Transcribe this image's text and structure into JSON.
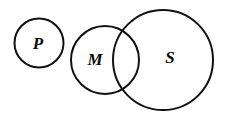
{
  "figure": {
    "type": "euler-diagram",
    "background_color": "#ffffff",
    "stroke_color": "#111111",
    "label_color": "#0a0a0a",
    "width": 228,
    "height": 120
  },
  "sets": [
    {
      "id": "P",
      "label": "P",
      "name": "circle-p",
      "cx": 39,
      "cy": 43,
      "r": 24.5,
      "label_x": 38,
      "label_y": 45,
      "label_size": 17,
      "overlaps": []
    },
    {
      "id": "M",
      "label": "M",
      "name": "circle-m",
      "cx": 105,
      "cy": 60,
      "r": 34,
      "label_x": 95,
      "label_y": 61,
      "label_size": 17,
      "overlaps": [
        "S"
      ]
    },
    {
      "id": "S",
      "label": "S",
      "name": "circle-s",
      "cx": 163,
      "cy": 60,
      "r": 50,
      "label_x": 170,
      "label_y": 59,
      "label_size": 17,
      "overlaps": [
        "M"
      ]
    }
  ],
  "chart_data": {
    "type": "euler-diagram",
    "title": "",
    "circles": [
      {
        "label": "P",
        "cx": 39,
        "cy": 43,
        "r": 24.5
      },
      {
        "label": "M",
        "cx": 105,
        "cy": 60,
        "r": 34
      },
      {
        "label": "S",
        "cx": 163,
        "cy": 60,
        "r": 50
      }
    ],
    "intersections": [
      [
        "M",
        "S"
      ]
    ],
    "disjoint": [
      [
        "P",
        "M"
      ],
      [
        "P",
        "S"
      ]
    ],
    "annotations": []
  }
}
